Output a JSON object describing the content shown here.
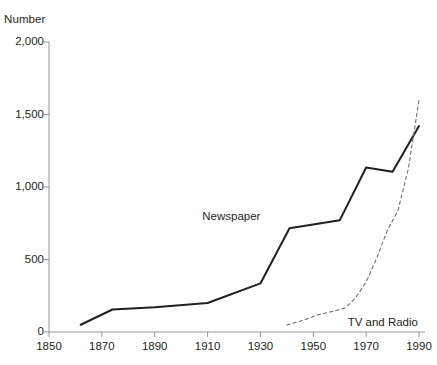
{
  "chart_data": {
    "type": "line",
    "title": "",
    "xlabel": "",
    "ylabel": "Number",
    "xlim": [
      1850,
      1990
    ],
    "ylim": [
      0,
      2000
    ],
    "grid": false,
    "legend_position": "inline-annotations",
    "xticks": [
      "1850",
      "1870",
      "1890",
      "1910",
      "1930",
      "1950",
      "1970",
      "1990"
    ],
    "yticks": [
      "0",
      "500",
      "1,000",
      "1,500",
      "2,000"
    ],
    "series": [
      {
        "name": "Newspaper",
        "style": "solid",
        "color": "#231f20",
        "label_x": 1908,
        "label_y": 790,
        "x": [
          1862,
          1874,
          1890,
          1910,
          1930,
          1941,
          1960,
          1970,
          1980,
          1990
        ],
        "values": [
          50,
          155,
          170,
          200,
          335,
          715,
          770,
          1135,
          1105,
          1420
        ]
      },
      {
        "name": "TV and Radio",
        "style": "dashed",
        "color": "#6d6e71",
        "label_x": 1963,
        "label_y": 65,
        "x": [
          1940,
          1946,
          1952,
          1958,
          1962,
          1966,
          1970,
          1974,
          1978,
          1982,
          1986,
          1990
        ],
        "values": [
          48,
          80,
          120,
          145,
          165,
          235,
          345,
          510,
          700,
          835,
          1130,
          1600
        ]
      }
    ]
  }
}
